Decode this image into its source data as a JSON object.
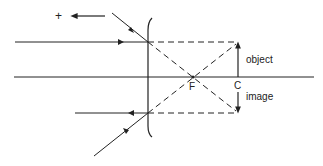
{
  "diagram": {
    "type": "ray diagram - concave mirror, object at C",
    "labels": {
      "sign": "+",
      "focus": "F",
      "centre": "C",
      "object": "object",
      "image": "image"
    },
    "colors": {
      "line": "#222222",
      "background": "#ffffff"
    }
  }
}
